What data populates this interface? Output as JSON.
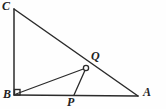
{
  "figure": {
    "type": "geometry-diagram",
    "canvas": {
      "width": 166,
      "height": 109
    },
    "background_color": "#fefefe",
    "stroke_color": "#2b2b2b",
    "label_color": "#222222",
    "points": [
      {
        "id": "C",
        "label": "C",
        "x": 14,
        "y": 9,
        "marker": "none"
      },
      {
        "id": "B",
        "label": "B",
        "x": 14,
        "y": 95,
        "marker": "right-angle-square"
      },
      {
        "id": "A",
        "label": "A",
        "x": 138,
        "y": 96,
        "marker": "none"
      },
      {
        "id": "Q",
        "label": "Q",
        "x": 86,
        "y": 68,
        "marker": "open-circle"
      },
      {
        "id": "P",
        "label": "P",
        "x": 74,
        "y": 95,
        "marker": "none"
      }
    ],
    "segments": [
      {
        "id": "BC",
        "from": "B",
        "to": "C",
        "name": "side-bc"
      },
      {
        "id": "BA",
        "from": "B",
        "to": "A",
        "name": "side-ba"
      },
      {
        "id": "CA",
        "from": "C",
        "to": "A",
        "name": "hypotenuse-ca"
      },
      {
        "id": "BQ",
        "from": "B",
        "to": "Q",
        "name": "segment-bq"
      },
      {
        "id": "PQ",
        "from": "P",
        "to": "Q",
        "name": "segment-pq"
      }
    ],
    "right_angle": {
      "at": "B",
      "size": 5
    }
  }
}
